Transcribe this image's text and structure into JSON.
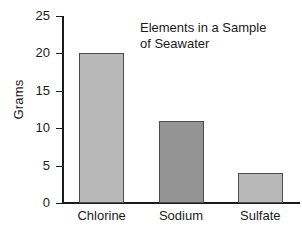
{
  "chart_data": {
    "type": "bar",
    "title": "Elements in a Sample of Seawater",
    "title_lines": [
      "Elements in a Sample",
      "of Seawater"
    ],
    "categories": [
      "Chlorine",
      "Sodium",
      "Sulfate"
    ],
    "values": [
      20,
      11,
      4
    ],
    "xlabel": "",
    "ylabel": "Grams",
    "ylim": [
      0,
      25
    ],
    "ytick_values": [
      0,
      5,
      10,
      15,
      20,
      25
    ],
    "ytick_labels": [
      "0",
      "5",
      "10",
      "15",
      "20",
      "25"
    ],
    "grid": false,
    "legend": "none",
    "bar_colors": [
      "#b8b8b8",
      "#949494",
      "#b8b8b8"
    ],
    "bar_edge_color": "#4d4d4d",
    "axis_color": "#1a1a1a",
    "background": "#ffffff"
  }
}
